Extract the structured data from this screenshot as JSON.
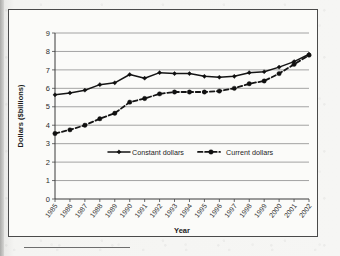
{
  "figure": {
    "y_axis_title": "Dollars ($billions)",
    "x_axis_title": "Year",
    "legend": {
      "constant_label": "Constant dollars",
      "current_label": "Current dollars"
    }
  },
  "chart_data": {
    "type": "line",
    "title": "",
    "xlabel": "Year",
    "ylabel": "Dollars ($billions)",
    "ylim": [
      0,
      9
    ],
    "ytick_labels": [
      "0",
      "1",
      "2",
      "3",
      "4",
      "5",
      "6",
      "7",
      "8",
      "9"
    ],
    "yticks": [
      0,
      1,
      2,
      3,
      4,
      5,
      6,
      7,
      8,
      9
    ],
    "grid": true,
    "legend_position": "center-inside",
    "categories": [
      "1985",
      "1986",
      "1987",
      "1988",
      "1989",
      "1990",
      "1991",
      "1992",
      "1993",
      "1994",
      "1995",
      "1996",
      "1997",
      "1998",
      "1999",
      "2000",
      "2001",
      "2002"
    ],
    "series": [
      {
        "name": "Constant dollars",
        "marker": "diamond",
        "line_style": "solid",
        "color": "#151515",
        "values": [
          5.65,
          5.75,
          5.9,
          6.2,
          6.3,
          6.75,
          6.55,
          6.85,
          6.8,
          6.8,
          6.65,
          6.6,
          6.65,
          6.85,
          6.9,
          7.15,
          7.45,
          7.85
        ]
      },
      {
        "name": "Current dollars",
        "marker": "circle",
        "line_style": "dashed",
        "color": "#151515",
        "values": [
          3.55,
          3.75,
          4.0,
          4.35,
          4.65,
          5.25,
          5.45,
          5.7,
          5.8,
          5.8,
          5.8,
          5.85,
          6.0,
          6.25,
          6.4,
          6.8,
          7.3,
          7.8
        ]
      }
    ]
  }
}
